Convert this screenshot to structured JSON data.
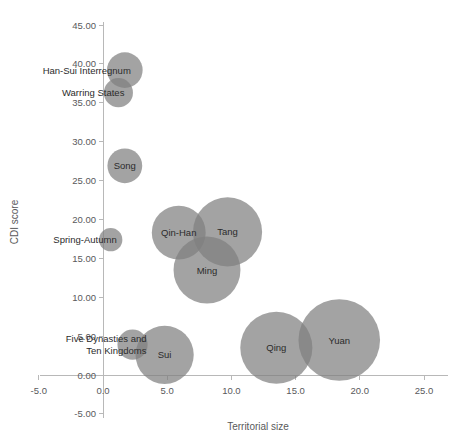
{
  "chart_data": {
    "type": "scatter",
    "title": "",
    "xlabel": "Territorial size",
    "ylabel": "CDI score",
    "xlim": [
      -5.0,
      25.0
    ],
    "ylim": [
      -5.0,
      45.0
    ],
    "grid": false,
    "legend": false,
    "bubble_color": "#7f7f7f",
    "xticks": [
      "-5.0",
      "0.0",
      "5.0",
      "10.0",
      "15.0",
      "20.0",
      "25.0"
    ],
    "xtick_values": [
      -5.0,
      0.0,
      5.0,
      10.0,
      15.0,
      20.0,
      25.0
    ],
    "yticks": [
      "-5.00",
      "0.00",
      "5.00",
      "10.00",
      "15.00",
      "20.00",
      "25.00",
      "30.00",
      "35.00",
      "40.00",
      "45.00"
    ],
    "ytick_values": [
      -5.0,
      0.0,
      5.0,
      10.0,
      15.0,
      20.0,
      25.0,
      30.0,
      35.0,
      40.0,
      45.0
    ],
    "points": [
      {
        "label": "Han-Sui Interregnum",
        "x": 1.7,
        "y": 39.2,
        "size": 2.1,
        "label_pos": "left"
      },
      {
        "label": "Warring States",
        "x": 1.2,
        "y": 36.3,
        "size": 1.4,
        "label_pos": "left"
      },
      {
        "label": "Song",
        "x": 1.7,
        "y": 26.9,
        "size": 2.0,
        "label_pos": "center"
      },
      {
        "label": "Spring-Autumn",
        "x": 0.6,
        "y": 17.4,
        "size": 0.9,
        "label_pos": "left"
      },
      {
        "label": "Qin-Han",
        "x": 5.9,
        "y": 18.3,
        "size": 4.8,
        "label_pos": "center"
      },
      {
        "label": "Tang",
        "x": 9.7,
        "y": 18.4,
        "size": 7.9,
        "label_pos": "center"
      },
      {
        "label": "Ming",
        "x": 8.1,
        "y": 13.5,
        "size": 7.4,
        "label_pos": "center"
      },
      {
        "label": "Five Dynasties and Ten Kingdoms",
        "x": 2.3,
        "y": 3.9,
        "size": 1.5,
        "label_pos": "left2"
      },
      {
        "label": "Sui",
        "x": 4.8,
        "y": 2.6,
        "size": 5.6,
        "label_pos": "center"
      },
      {
        "label": "Qing",
        "x": 13.5,
        "y": 3.5,
        "size": 8.6,
        "label_pos": "center"
      },
      {
        "label": "Yuan",
        "x": 18.4,
        "y": 4.5,
        "size": 11.0,
        "label_pos": "center"
      }
    ],
    "multiline_labels": {
      "Five Dynasties and Ten Kingdoms": [
        "Five Dynasties and",
        "Ten Kingdoms"
      ]
    }
  }
}
